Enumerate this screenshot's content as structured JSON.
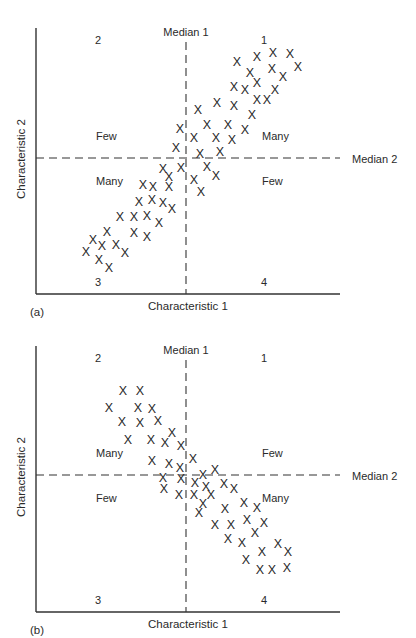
{
  "chart_data": [
    {
      "type": "scatter",
      "panel_label": "(a)",
      "title": "",
      "xlabel": "Characteristic 1",
      "ylabel": "Characteristic 2",
      "median_x_label": "Median 1",
      "median_y_label": "Median 2",
      "quadrant_numbers": {
        "q1": "1",
        "q2": "2",
        "q3": "3",
        "q4": "4"
      },
      "quadrant_labels": {
        "upper_left": "Few",
        "upper_right": "Many",
        "lower_left": "Many",
        "lower_right": "Few"
      },
      "grid": false,
      "marker": "X",
      "pixel_frame": {
        "x0": 36,
        "x1": 340,
        "y_top": 28,
        "y_bottom": 294,
        "median_x": 186,
        "median_y": 158
      },
      "points": [
        [
          237,
          61
        ],
        [
          257,
          56
        ],
        [
          273,
          52
        ],
        [
          290,
          53
        ],
        [
          298,
          66
        ],
        [
          250,
          72
        ],
        [
          272,
          68
        ],
        [
          283,
          76
        ],
        [
          257,
          82
        ],
        [
          234,
          86
        ],
        [
          245,
          89
        ],
        [
          275,
          89
        ],
        [
          257,
          99
        ],
        [
          267,
          99
        ],
        [
          217,
          102
        ],
        [
          234,
          105
        ],
        [
          198,
          109
        ],
        [
          252,
          114
        ],
        [
          207,
          124
        ],
        [
          228,
          124
        ],
        [
          245,
          129
        ],
        [
          180,
          128
        ],
        [
          194,
          137
        ],
        [
          216,
          137
        ],
        [
          232,
          139
        ],
        [
          176,
          147
        ],
        [
          200,
          153
        ],
        [
          220,
          151
        ],
        [
          163,
          168
        ],
        [
          169,
          176
        ],
        [
          181,
          167
        ],
        [
          207,
          166
        ],
        [
          216,
          175
        ],
        [
          194,
          179
        ],
        [
          201,
          191
        ],
        [
          143,
          184
        ],
        [
          153,
          186
        ],
        [
          169,
          186
        ],
        [
          139,
          201
        ],
        [
          152,
          199
        ],
        [
          163,
          202
        ],
        [
          172,
          208
        ],
        [
          120,
          216
        ],
        [
          134,
          216
        ],
        [
          147,
          215
        ],
        [
          159,
          222
        ],
        [
          107,
          231
        ],
        [
          134,
          232
        ],
        [
          147,
          236
        ],
        [
          93,
          239
        ],
        [
          102,
          245
        ],
        [
          116,
          244
        ],
        [
          125,
          252
        ],
        [
          86,
          251
        ],
        [
          99,
          259
        ],
        [
          109,
          267
        ]
      ]
    },
    {
      "type": "scatter",
      "panel_label": "(b)",
      "title": "",
      "xlabel": "Characteristic 1",
      "ylabel": "Characteristic 2",
      "median_x_label": "Median 1",
      "median_y_label": "Median 2",
      "quadrant_numbers": {
        "q1": "1",
        "q2": "2",
        "q3": "3",
        "q4": "4"
      },
      "quadrant_labels": {
        "upper_left": "Many",
        "upper_right": "Few",
        "lower_left": "Few",
        "lower_right": "Many"
      },
      "grid": false,
      "marker": "X",
      "pixel_frame": {
        "x0": 36,
        "x1": 340,
        "y_top": 346,
        "y_bottom": 612,
        "median_x": 186,
        "median_y": 475
      },
      "points": [
        [
          123,
          390
        ],
        [
          140,
          390
        ],
        [
          109,
          407
        ],
        [
          138,
          407
        ],
        [
          152,
          408
        ],
        [
          122,
          421
        ],
        [
          140,
          422
        ],
        [
          158,
          420
        ],
        [
          172,
          432
        ],
        [
          128,
          439
        ],
        [
          151,
          439
        ],
        [
          165,
          442
        ],
        [
          181,
          445
        ],
        [
          193,
          458
        ],
        [
          152,
          460
        ],
        [
          169,
          463
        ],
        [
          180,
          467
        ],
        [
          215,
          469
        ],
        [
          203,
          474
        ],
        [
          163,
          477
        ],
        [
          181,
          478
        ],
        [
          195,
          482
        ],
        [
          206,
          486
        ],
        [
          224,
          483
        ],
        [
          234,
          488
        ],
        [
          164,
          488
        ],
        [
          179,
          494
        ],
        [
          194,
          494
        ],
        [
          211,
          494
        ],
        [
          203,
          503
        ],
        [
          244,
          502
        ],
        [
          257,
          507
        ],
        [
          225,
          508
        ],
        [
          199,
          512
        ],
        [
          247,
          519
        ],
        [
          264,
          522
        ],
        [
          215,
          524
        ],
        [
          231,
          524
        ],
        [
          255,
          532
        ],
        [
          228,
          538
        ],
        [
          242,
          542
        ],
        [
          278,
          543
        ],
        [
          262,
          551
        ],
        [
          288,
          551
        ],
        [
          246,
          559
        ],
        [
          260,
          569
        ],
        [
          272,
          569
        ],
        [
          287,
          567
        ]
      ]
    }
  ]
}
